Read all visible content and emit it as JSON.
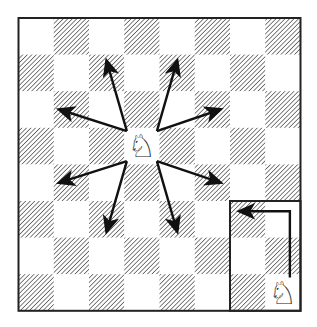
{
  "diagram": {
    "board": {
      "files": [
        "a",
        "b",
        "c",
        "d",
        "e",
        "f",
        "g",
        "h"
      ],
      "ranks": [
        8,
        7,
        6,
        5,
        4,
        3,
        2,
        1
      ],
      "light_color": "#ffffff",
      "dark_style": "hatched",
      "hatch_color": "#555555",
      "border_color": "#222222"
    },
    "pieces": [
      {
        "id": "center-knight",
        "type": "knight",
        "color": "white",
        "glyph": "♘",
        "square": "d5"
      },
      {
        "id": "corner-knight",
        "type": "knight",
        "color": "white",
        "glyph": "♘",
        "square": "h1"
      }
    ],
    "center_moves": {
      "from": "d5",
      "targets": [
        "b6",
        "c7",
        "e7",
        "f6",
        "b4",
        "c3",
        "e3",
        "f4"
      ]
    },
    "inset": {
      "label": "corner-inset",
      "squares": [
        "g3",
        "h3",
        "g2",
        "h2",
        "g1",
        "h1"
      ],
      "path": {
        "from": "h1",
        "via": "h3",
        "to": "g3"
      }
    },
    "arrow_color": "#111111"
  }
}
